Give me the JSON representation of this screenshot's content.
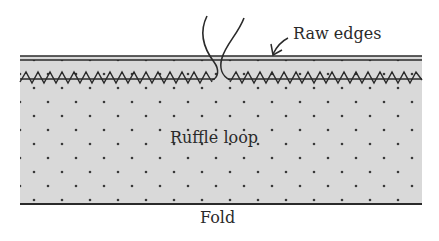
{
  "diagram": {
    "type": "sewing-illustration",
    "labels": {
      "raw_edges": "Raw edges",
      "ruffle_loop": "Ruffle loop",
      "fold": "Fold"
    },
    "colors": {
      "fabric_fill": "#d9d9d9",
      "dot": "#3a3a3a",
      "line": "#2a2a2a",
      "background": "#ffffff"
    }
  }
}
